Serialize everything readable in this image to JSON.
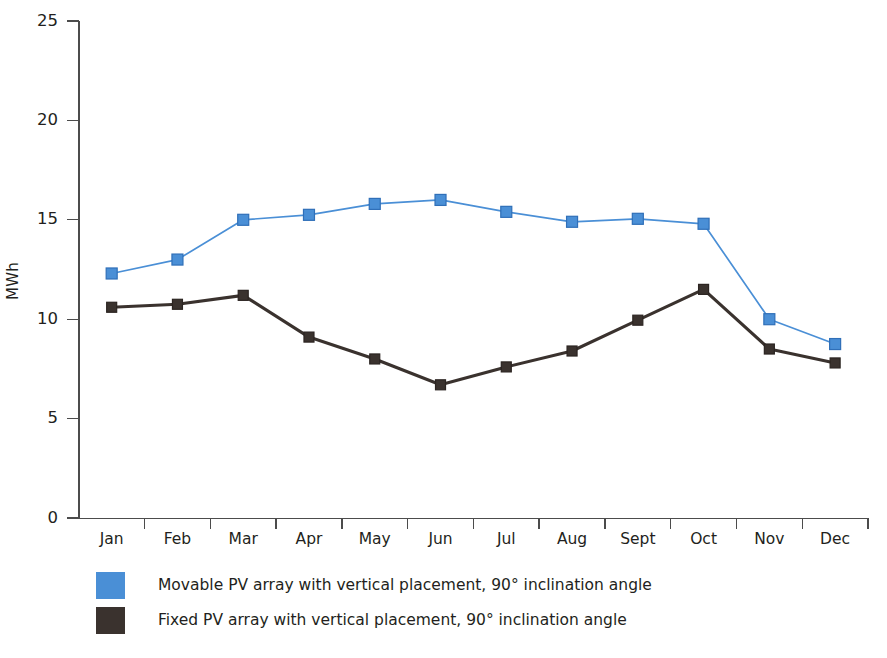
{
  "chart_data": {
    "type": "line",
    "title": "",
    "xlabel": "",
    "ylabel": "MWh",
    "ylim": [
      0,
      25
    ],
    "yticks": [
      0,
      5,
      10,
      15,
      20,
      25
    ],
    "ytick_labels": [
      "0",
      "5",
      "10",
      "15",
      "20",
      "25"
    ],
    "grid": false,
    "legend_position": "below-left",
    "categories": [
      "Jan",
      "Feb",
      "Mar",
      "Apr",
      "May",
      "Jun",
      "Jul",
      "Aug",
      "Sept",
      "Oct",
      "Nov",
      "Dec"
    ],
    "series": [
      {
        "name": "Movable PV array with vertical placement, 90° inclination angle",
        "color": "#4a8fd6",
        "marker": "square",
        "values": [
          12.3,
          13.0,
          15.0,
          15.25,
          15.8,
          16.0,
          15.4,
          14.9,
          15.05,
          14.8,
          10.0,
          8.75
        ]
      },
      {
        "name": "Fixed PV array with vertical placement, 90° inclination angle",
        "color": "#3a322e",
        "marker": "square",
        "values": [
          10.6,
          10.75,
          11.2,
          9.1,
          8.0,
          6.7,
          7.6,
          8.4,
          9.95,
          11.5,
          8.5,
          7.8
        ]
      }
    ]
  },
  "axes": {
    "y_label": "MWh",
    "y_tick_labels": [
      "25",
      "20",
      "15",
      "10",
      "5",
      "0"
    ],
    "x_tick_labels": [
      "Jan",
      "Feb",
      "Mar",
      "Apr",
      "May",
      "Jun",
      "Jul",
      "Aug",
      "Sept",
      "Oct",
      "Nov",
      "Dec"
    ]
  },
  "legend": {
    "items": [
      {
        "label": "Movable PV array with vertical placement, 90° inclination angle",
        "color": "#4a8fd6"
      },
      {
        "label": "Fixed PV array with vertical placement, 90° inclination angle",
        "color": "#3a322e"
      }
    ]
  },
  "colors": {
    "series_movable": "#4a8fd6",
    "series_fixed": "#3a322e",
    "axis": "#4c4c4c",
    "text": "#231f20",
    "background": "#ffffff"
  }
}
